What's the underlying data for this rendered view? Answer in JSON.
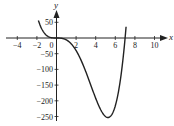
{
  "chart_data": {
    "type": "line",
    "title": "",
    "xlabel": "x",
    "ylabel": "y",
    "xlim": [
      -5,
      11
    ],
    "ylim": [
      -260,
      60
    ],
    "grid": false,
    "legend": null,
    "x_ticks": [
      -4,
      -2,
      0,
      2,
      4,
      6,
      8,
      10
    ],
    "x_tick_labels": [
      "−4",
      "−2",
      "0",
      "2",
      "4",
      "6",
      "8",
      "10"
    ],
    "y_ticks": [
      50,
      -50,
      -100,
      -150,
      -200,
      -250
    ],
    "y_tick_labels": [
      "50",
      "−50",
      "−100",
      "−150",
      "−200",
      "−250"
    ],
    "series": [
      {
        "name": "f(x)",
        "color": "#222222",
        "x": [
          -1.85,
          -1.5,
          -1.0,
          -0.5,
          0,
          0.5,
          1.0,
          1.5,
          2.0,
          2.5,
          3.0,
          3.5,
          4.0,
          4.5,
          5.0,
          5.25,
          5.5,
          6.0,
          6.5,
          7.0,
          7.1
        ],
        "y": [
          56,
          29.5,
          8,
          0.9,
          0,
          -0.8,
          -6,
          -18.6,
          -40,
          -70.3,
          -108,
          -150,
          -192,
          -228,
          -250,
          -253,
          -246,
          -216,
          -137,
          0,
          35.8
        ]
      }
    ],
    "annotations": []
  }
}
